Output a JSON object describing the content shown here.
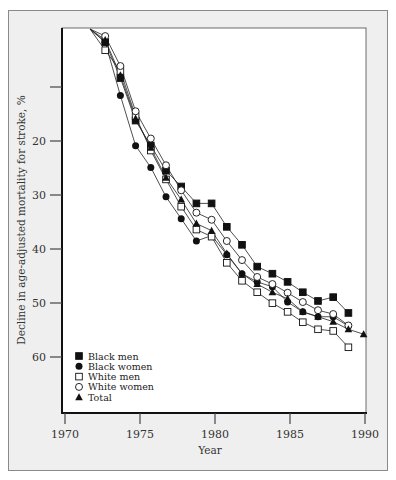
{
  "chart_data": {
    "type": "line",
    "title": "",
    "xlabel": "Year",
    "ylabel": "Decline in age-adjusted mortality for stroke, %",
    "xlim": [
      1970,
      1990
    ],
    "ylim": [
      0,
      70
    ],
    "y_inverted": true,
    "x_ticks": [
      1970,
      1975,
      1980,
      1985,
      1990
    ],
    "y_ticks": [
      10,
      20,
      30,
      40,
      50,
      60
    ],
    "y_tick_labels": [
      "",
      "20",
      "30",
      "40",
      "50",
      "60"
    ],
    "grid": false,
    "legend_position": "lower-left inside",
    "x": [
      1972,
      1973,
      1974,
      1975,
      1976,
      1977,
      1978,
      1979,
      1980,
      1981,
      1982,
      1983,
      1984,
      1985,
      1986,
      1987,
      1988,
      1989,
      1990
    ],
    "series": [
      {
        "name": "Black men",
        "marker": "filled-square",
        "values": [
          0,
          2.4,
          9.0,
          16.8,
          21.4,
          26.0,
          28.9,
          32.0,
          32.0,
          36.3,
          39.6,
          43.6,
          44.9,
          46.4,
          48.3,
          49.9,
          49.2,
          52.1,
          null
        ]
      },
      {
        "name": "Black women",
        "marker": "filled-circle",
        "values": [
          0,
          2.4,
          12.2,
          21.4,
          25.4,
          30.8,
          34.8,
          38.9,
          37.9,
          41.4,
          44.9,
          46.4,
          47.3,
          50.1,
          51.9,
          52.8,
          52.8,
          54.5,
          null
        ]
      },
      {
        "name": "White men",
        "marker": "open-square",
        "values": [
          0,
          3.9,
          7.7,
          16.0,
          22.3,
          27.6,
          32.6,
          36.8,
          38.1,
          42.9,
          46.2,
          48.3,
          50.3,
          51.9,
          53.8,
          55.1,
          55.4,
          58.4,
          null
        ]
      },
      {
        "name": "White women",
        "marker": "open-circle",
        "values": [
          0,
          1.3,
          6.8,
          15.1,
          20.1,
          25.0,
          29.6,
          33.7,
          35.0,
          38.9,
          42.4,
          45.5,
          46.8,
          48.4,
          50.1,
          51.6,
          52.3,
          54.4,
          null
        ]
      },
      {
        "name": "Total",
        "marker": "filled-triangle",
        "values": [
          0,
          2.0,
          8.5,
          16.4,
          21.8,
          27.3,
          31.3,
          35.7,
          37.0,
          41.2,
          44.9,
          46.8,
          48.3,
          49.5,
          51.9,
          52.8,
          53.7,
          55.1,
          56.0
        ]
      }
    ]
  },
  "colors": {
    "frame_bg": "#efefef",
    "plot_bg": "#ffffff",
    "ink": "#111111"
  }
}
